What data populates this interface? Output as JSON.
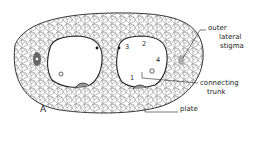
{
  "figure": {
    "panel_label": "A",
    "labels": {
      "outer_lateral_stigma": [
        "outer",
        "lateral",
        "stigma"
      ],
      "connecting_trunk": [
        "connecting",
        "trunk"
      ],
      "plate": "plate"
    },
    "numbers": [
      "3",
      "2",
      "4",
      "1"
    ],
    "colors": {
      "line": "#222222",
      "background": "#ffffff"
    }
  }
}
